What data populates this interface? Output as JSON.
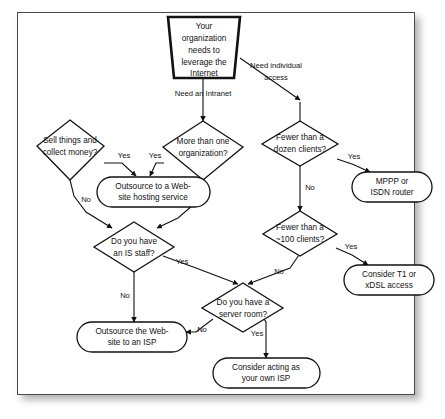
{
  "figure": {
    "kind": "flowchart"
  },
  "nodes": {
    "start": {
      "id": "start",
      "shape": "trapezoid",
      "lines": [
        "Your",
        "organization",
        "needs to",
        "leverage the",
        "Internet"
      ]
    },
    "sell_things": {
      "id": "sell_things",
      "shape": "diamond",
      "lines": [
        "Sell things and",
        "collect money?"
      ]
    },
    "more_than_one_org": {
      "id": "more_than_one_org",
      "shape": "diamond",
      "lines": [
        "More than one",
        "organization?"
      ]
    },
    "fewer_dozen": {
      "id": "fewer_dozen",
      "shape": "diamond",
      "lines": [
        "Fewer than a",
        "dozen clients?"
      ]
    },
    "fewer_100": {
      "id": "fewer_100",
      "shape": "diamond",
      "lines": [
        "Fewer than a",
        "~100 clients?"
      ]
    },
    "is_staff": {
      "id": "is_staff",
      "shape": "diamond",
      "lines": [
        "Do you have",
        "an IS staff?"
      ]
    },
    "server_room": {
      "id": "server_room",
      "shape": "diamond",
      "lines": [
        "Do you have a",
        "server room?"
      ]
    },
    "outsource_hosting": {
      "id": "outsource_hosting",
      "shape": "rounded",
      "lines": [
        "Outsource to a Web-",
        "site hosting service"
      ]
    },
    "mppp_isdn": {
      "id": "mppp_isdn",
      "shape": "rounded",
      "lines": [
        "MPPP or",
        "ISDN router"
      ]
    },
    "t1_xdsl": {
      "id": "t1_xdsl",
      "shape": "rounded",
      "lines": [
        "Consider T1 or",
        "xDSL access"
      ]
    },
    "outsource_isp": {
      "id": "outsource_isp",
      "shape": "rounded",
      "lines": [
        "Outsource the Web-",
        "site to an ISP"
      ]
    },
    "own_isp": {
      "id": "own_isp",
      "shape": "rounded",
      "lines": [
        "Consider acting as",
        "your own ISP"
      ]
    }
  },
  "edge_labels": {
    "need_intranet": "Need an Intranet",
    "need_individual_1": "Need individual",
    "need_individual_2": "access",
    "sell_yes": "Yes",
    "sell_no": "No",
    "org_yes": "Yes",
    "org_no": "No",
    "dozen_yes": "Yes",
    "dozen_no": "No",
    "hundred_yes": "Yes",
    "hundred_no": "No",
    "staff_yes": "Yes",
    "staff_no": "No",
    "room_yes": "Yes",
    "room_no": "No"
  },
  "colors": {
    "line": "#111111",
    "shape_fill": "#ffffff",
    "frame_border": "#4a4a4a",
    "page_background": "#ffffff"
  }
}
